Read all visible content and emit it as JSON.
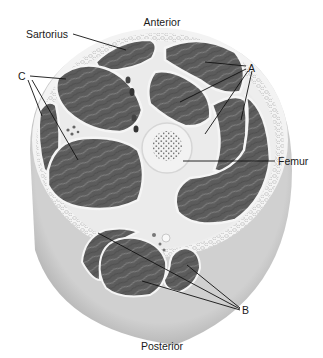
{
  "diagram": {
    "orientation": {
      "top": "Anterior",
      "bottom": "Posterior"
    },
    "labels": {
      "sartorius": "Sartorius",
      "group_a": "A",
      "group_b": "B",
      "group_c": "C",
      "femur": "Femur"
    },
    "colors": {
      "background": "#ffffff",
      "muscle": "#5e5e5e",
      "muscle_dark": "#4a4a4a",
      "fascia": "#ececec",
      "skin": "#bdbdbd",
      "fat": "#f2f2f2",
      "bone": "#f0f0f0",
      "marrow": "#6a6a6a",
      "leader_line": "#111111"
    }
  }
}
